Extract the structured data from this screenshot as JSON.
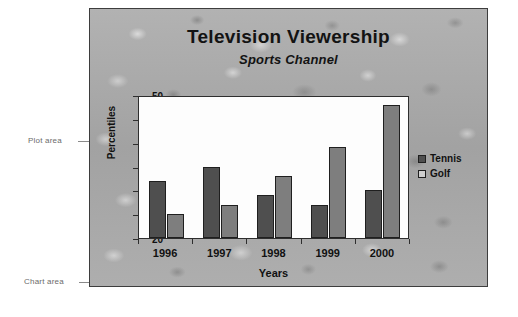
{
  "annotations": {
    "plot_area_label": "Plot area",
    "chart_area_label": "Chart area"
  },
  "chart_data": {
    "type": "bar",
    "title": "Television Viewership",
    "subtitle": "Sports Channel",
    "xlabel": "Years",
    "ylabel": "Percentiles",
    "categories": [
      "1996",
      "1997",
      "1998",
      "1999",
      "2000"
    ],
    "series": [
      {
        "name": "Tennis",
        "color": "#4f4f4f",
        "values": [
          32,
          35,
          29,
          27,
          30
        ]
      },
      {
        "name": "Golf",
        "color": "#7e7e7e",
        "values": [
          25,
          27,
          33,
          39,
          48
        ]
      }
    ],
    "ylim": [
      20,
      50
    ],
    "yticks": [
      20,
      25,
      30,
      35,
      40,
      45,
      50
    ],
    "grid": false,
    "legend_position": "right"
  }
}
